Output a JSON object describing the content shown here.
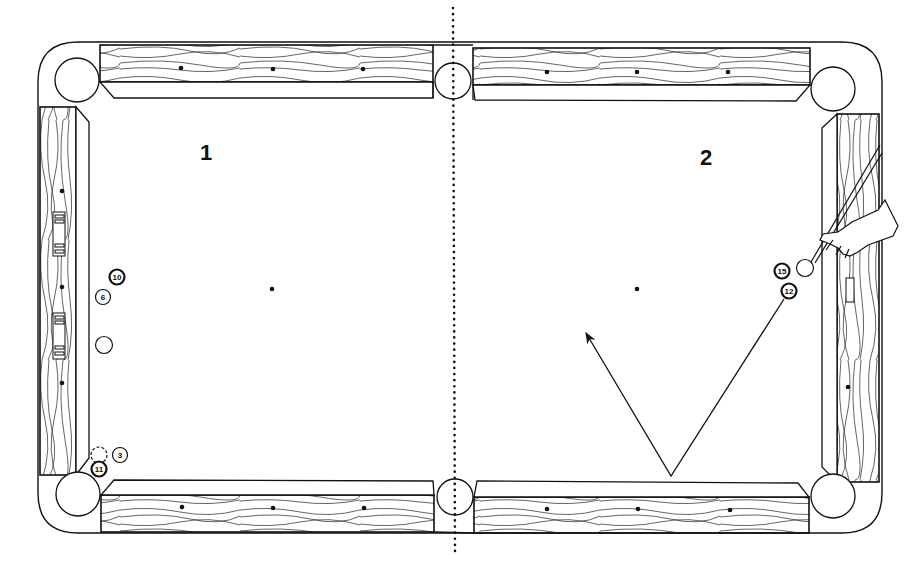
{
  "diagram": {
    "zones": [
      {
        "label": "1",
        "x": 200,
        "y": 143
      },
      {
        "label": "2",
        "x": 700,
        "y": 148
      }
    ],
    "divider": {
      "style": "dotted",
      "x": 453
    },
    "spots": [
      {
        "name": "head-spot",
        "x": 272,
        "y": 289
      },
      {
        "name": "foot-spot",
        "x": 637,
        "y": 289
      }
    ],
    "balls": [
      {
        "id": "ball-10",
        "number": "10",
        "type": "stripe",
        "x": 117,
        "y": 277
      },
      {
        "id": "ball-6",
        "number": "6",
        "type": "solid",
        "x": 103,
        "y": 297
      },
      {
        "id": "cue-ball-zone1",
        "number": "",
        "type": "cue",
        "x": 104,
        "y": 345
      },
      {
        "id": "ball-3-ghost",
        "number": "",
        "type": "ghost",
        "x": 98,
        "y": 455
      },
      {
        "id": "ball-3",
        "number": "3",
        "type": "solid",
        "x": 120,
        "y": 455
      },
      {
        "id": "ball-11",
        "number": "11",
        "type": "stripe",
        "x": 99,
        "y": 469
      },
      {
        "id": "ball-15",
        "number": "15",
        "type": "stripe",
        "x": 782,
        "y": 271
      },
      {
        "id": "cue-ball-zone2",
        "number": "",
        "type": "cue",
        "x": 805,
        "y": 268
      },
      {
        "id": "ball-12",
        "number": "12",
        "type": "stripe",
        "x": 789,
        "y": 291
      }
    ],
    "shot_path": {
      "start": {
        "x": 784,
        "y": 299
      },
      "bank": {
        "x": 671,
        "y": 476
      },
      "end": {
        "x": 586,
        "y": 333
      }
    },
    "colors": {
      "ink": "#111111",
      "paper": "#ffffff"
    }
  }
}
